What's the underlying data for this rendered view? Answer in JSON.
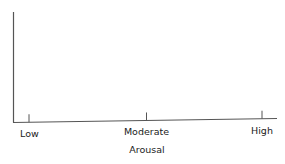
{
  "chart_data": {
    "type": "line",
    "title": "",
    "xlabel": "Arousal",
    "ylabel": "",
    "categories": [
      "Low",
      "Moderate",
      "High"
    ],
    "series": [],
    "grid": false,
    "legend": "none"
  },
  "colors": {
    "axis": "#555555",
    "text": "#222222"
  }
}
